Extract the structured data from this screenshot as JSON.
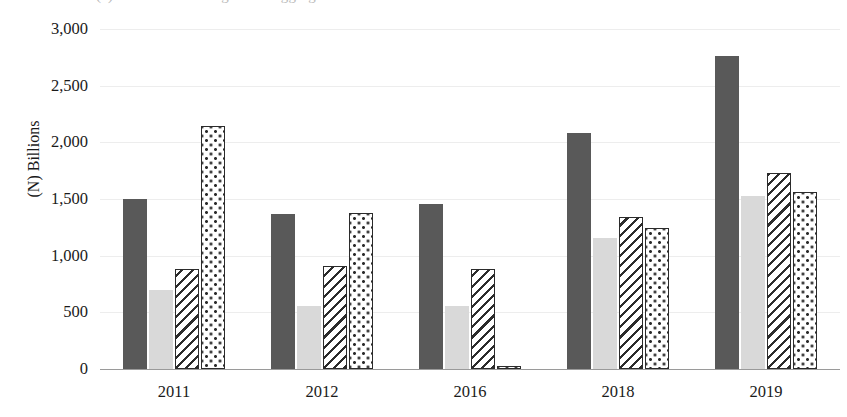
{
  "top_clipped_text": "(a) Trends in banking sector aggregates",
  "chart_data": {
    "type": "bar",
    "title": "",
    "subtitle": "",
    "xlabel": "",
    "ylabel": "(N) Billions",
    "categories": [
      "2011",
      "2012",
      "2016",
      "2018",
      "2019"
    ],
    "ylim": [
      0,
      3000
    ],
    "yticks": [
      0,
      500,
      1000,
      1500,
      2000,
      2500,
      3000
    ],
    "ytick_labels": [
      "0",
      "500",
      "1,000",
      "1,500",
      "2,000",
      "2,500",
      "3,000"
    ],
    "grid": true,
    "legend": "none",
    "series": [
      {
        "name": "series-1",
        "pattern": "solid-dark-gray",
        "color": "#595959",
        "values": [
          1500,
          1370,
          1460,
          2080,
          2760
        ]
      },
      {
        "name": "series-2",
        "pattern": "solid-light-gray",
        "color": "#d9d9d9",
        "values": [
          700,
          560,
          555,
          1160,
          1530
        ]
      },
      {
        "name": "series-3",
        "pattern": "diagonal-hatch",
        "color": "#2b2b2b",
        "values": [
          880,
          910,
          880,
          1340,
          1730
        ]
      },
      {
        "name": "series-4",
        "pattern": "dotted",
        "color": "#2b2b2b",
        "values": [
          2140,
          1380,
          30,
          1240,
          1560
        ]
      }
    ]
  }
}
